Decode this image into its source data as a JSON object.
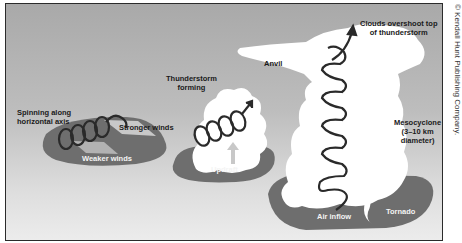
{
  "figure": {
    "credit": "© Kendall Hunt Publishing Company."
  },
  "stages": [
    {
      "id": "stage-1",
      "labels": {
        "spinning": "Spinning along\nhorizontal axis",
        "spinning_line1": "Spinning along",
        "spinning_line2": "horizontal axis",
        "stronger": "Stronger winds",
        "weaker": "Weaker winds"
      }
    },
    {
      "id": "stage-2",
      "labels": {
        "forming_line1": "Thunderstorm",
        "forming_line2": "forming",
        "updraft": "Updraft"
      }
    },
    {
      "id": "stage-3",
      "labels": {
        "overshoot_line1": "Clouds overshoot top",
        "overshoot_line2": "of thunderstorm",
        "anvil": "Anvil",
        "meso_line1": "Mesocyclone",
        "meso_line2": "(3–10 km",
        "meso_line3": "diameter)",
        "air_inflow": "Air inflow",
        "tornado": "Tornado"
      }
    }
  ],
  "colors": {
    "ground": "#6e6e6e",
    "cloud": "#ffffff",
    "spiral": "#2a2a2a",
    "background_top": "#a9a9a9",
    "background_bottom": "#ececec"
  }
}
